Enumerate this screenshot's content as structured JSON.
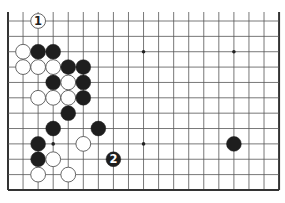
{
  "board": {
    "columns": 19,
    "rows": 12,
    "open_top": true,
    "origin_x": 8,
    "origin_y": 21,
    "spacing_x": 15.06,
    "spacing_y": 15.36,
    "stone_radius": 7.4,
    "colors": {
      "line": "#555555",
      "edge": "#333333",
      "black": "#1e1e1e",
      "white": "#ffffff",
      "white_outline": "#555555"
    }
  },
  "star_points": [
    {
      "col": 9,
      "row": 2
    },
    {
      "col": 15,
      "row": 2
    },
    {
      "col": 3,
      "row": 8
    },
    {
      "col": 9,
      "row": 8
    }
  ],
  "stones": [
    {
      "color": "white",
      "col": 2,
      "row": 0,
      "label": "1"
    },
    {
      "color": "white",
      "col": 1,
      "row": 2
    },
    {
      "color": "black",
      "col": 2,
      "row": 2
    },
    {
      "color": "black",
      "col": 3,
      "row": 2
    },
    {
      "color": "white",
      "col": 1,
      "row": 3
    },
    {
      "color": "white",
      "col": 2,
      "row": 3
    },
    {
      "color": "white",
      "col": 3,
      "row": 3
    },
    {
      "color": "black",
      "col": 4,
      "row": 3
    },
    {
      "color": "black",
      "col": 5,
      "row": 3
    },
    {
      "color": "black",
      "col": 3,
      "row": 4
    },
    {
      "color": "white",
      "col": 4,
      "row": 4
    },
    {
      "color": "black",
      "col": 5,
      "row": 4
    },
    {
      "color": "white",
      "col": 2,
      "row": 5
    },
    {
      "color": "white",
      "col": 3,
      "row": 5
    },
    {
      "color": "white",
      "col": 4,
      "row": 5
    },
    {
      "color": "black",
      "col": 5,
      "row": 5
    },
    {
      "color": "black",
      "col": 4,
      "row": 6
    },
    {
      "color": "black",
      "col": 3,
      "row": 7
    },
    {
      "color": "black",
      "col": 6,
      "row": 7
    },
    {
      "color": "black",
      "col": 2,
      "row": 8
    },
    {
      "color": "white",
      "col": 5,
      "row": 8
    },
    {
      "color": "black",
      "col": 15,
      "row": 8
    },
    {
      "color": "black",
      "col": 2,
      "row": 9
    },
    {
      "color": "white",
      "col": 3,
      "row": 9
    },
    {
      "color": "black",
      "col": 7,
      "row": 9,
      "label": "2"
    },
    {
      "color": "white",
      "col": 2,
      "row": 10
    },
    {
      "color": "white",
      "col": 4,
      "row": 10
    }
  ]
}
